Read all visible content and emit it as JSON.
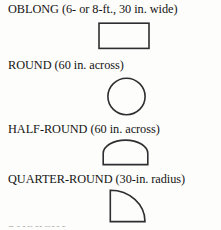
{
  "page": {
    "background_color": "#fdfdfb",
    "ink_color": "#2e2e30",
    "text_color": "#141414"
  },
  "entries": [
    {
      "caption": "OBLONG (6- or 8-ft., 30 in. wide)",
      "shape": "rectangle",
      "shape_name": "oblong-table-shape"
    },
    {
      "caption": "ROUND (60 in. across)",
      "shape": "circle",
      "shape_name": "round-table-shape"
    },
    {
      "caption": "HALF-ROUND (60 in. across)",
      "shape": "semicircle",
      "shape_name": "half-round-table-shape"
    },
    {
      "caption": "QUARTER-ROUND (30-in. radius)",
      "shape": "quarter-circle",
      "shape_name": "quarter-round-table-shape"
    }
  ],
  "bottom_sliver": {
    "text": "STRAIGHT"
  }
}
